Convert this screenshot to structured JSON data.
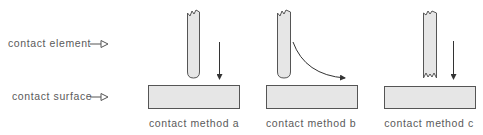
{
  "labels": {
    "element": "contact element",
    "surface": "contact surface"
  },
  "methods": [
    {
      "caption": "contact method a",
      "motion": "vertical"
    },
    {
      "caption": "contact method b",
      "motion": "curved"
    },
    {
      "caption": "contact method c",
      "motion": "vertical"
    }
  ],
  "colors": {
    "fill": "#e6e6e6",
    "stroke": "#555555",
    "text": "#5a5a5a"
  }
}
